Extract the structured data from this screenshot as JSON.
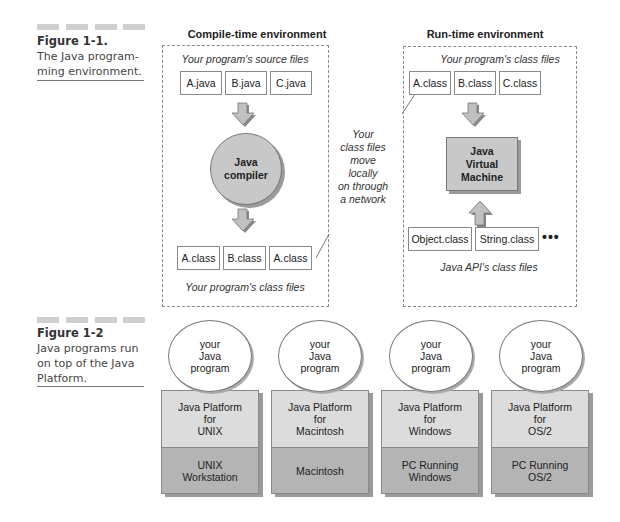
{
  "figure1": {
    "caption": {
      "title": "Figure 1-1.",
      "lines": [
        "The Java program-",
        "ming environment."
      ]
    },
    "compile_time": {
      "title": "Compile-time environment",
      "source_label": "Your program's source files",
      "source_files": [
        "A.java",
        "B.java",
        "C.java"
      ],
      "compiler": [
        "Java",
        "compiler"
      ],
      "class_files": [
        "A.class",
        "B.class",
        "A.class"
      ],
      "class_label": "Your program's class files"
    },
    "transfer_note": [
      "Your",
      "class files",
      "move",
      "locally",
      "on through",
      "a network"
    ],
    "run_time": {
      "title": "Run-time environment",
      "class_label": "Your program's class files",
      "class_files": [
        "A.class",
        "B.class",
        "C.class"
      ],
      "jvm": [
        "Java",
        "Virtual",
        "Machine"
      ],
      "api_files": [
        "Object.class",
        "String.class"
      ],
      "ellipsis": "•••",
      "api_label": "Java API's class files"
    }
  },
  "figure2": {
    "caption": {
      "title": "Figure 1-2",
      "lines": [
        "Java programs run",
        "on top of the Java",
        "Platform."
      ]
    },
    "stacks": [
      {
        "program": [
          "your",
          "Java",
          "program"
        ],
        "platform": [
          "Java Platform",
          "for",
          "UNIX"
        ],
        "os": [
          "UNIX",
          "Workstation"
        ]
      },
      {
        "program": [
          "your",
          "Java",
          "program"
        ],
        "platform": [
          "Java Platform",
          "for",
          "Macintosh"
        ],
        "os": [
          "Macintosh"
        ]
      },
      {
        "program": [
          "your",
          "Java",
          "program"
        ],
        "platform": [
          "Java Platform",
          "for",
          "Windows"
        ],
        "os": [
          "PC Running",
          "Windows"
        ]
      },
      {
        "program": [
          "your",
          "Java",
          "program"
        ],
        "platform": [
          "Java Platform",
          "for",
          "OS/2"
        ],
        "os": [
          "PC Running",
          "OS/2"
        ]
      }
    ]
  },
  "colors": {
    "platform_fill": "#dcdcdc",
    "os_fill": "#b4b4b4",
    "node_fill": "#c8c8c8",
    "arrow_fill": "#c0c0c0"
  }
}
